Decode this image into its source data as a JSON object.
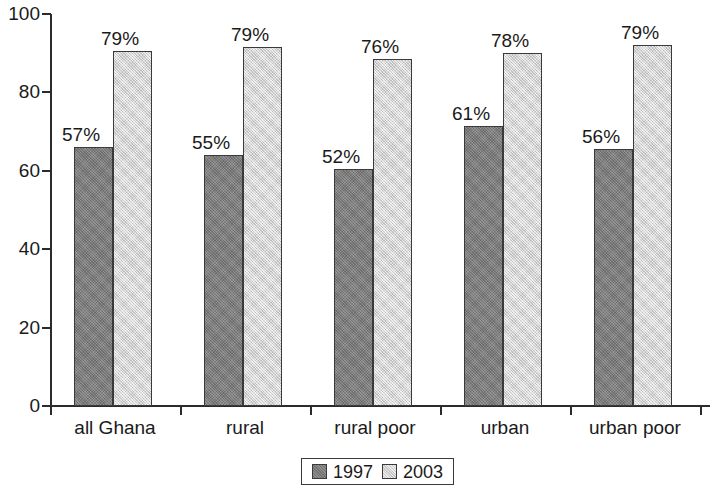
{
  "chart_data": {
    "type": "bar",
    "title": "",
    "subtitle": "",
    "xlabel": "",
    "ylabel": "",
    "ylim": [
      0,
      100
    ],
    "yticks": [
      0,
      20,
      40,
      60,
      80,
      100
    ],
    "ytick_labels": [
      "0",
      "20",
      "40",
      "60",
      "80",
      "100"
    ],
    "grid": false,
    "legend_position": "bottom-center",
    "categories": [
      "all Ghana",
      "rural",
      "rural poor",
      "urban",
      "urban poor"
    ],
    "series": [
      {
        "name": "1997",
        "color": "#808080",
        "values": [
          66,
          64,
          60.5,
          71.5,
          65.5
        ],
        "data_labels": [
          "57%",
          "55%",
          "52%",
          "61%",
          "56%"
        ]
      },
      {
        "name": "2003",
        "color": "#dcdcdc",
        "values": [
          90.5,
          91.5,
          88.5,
          90,
          92
        ],
        "data_labels": [
          "79%",
          "79%",
          "76%",
          "78%",
          "79%"
        ]
      }
    ],
    "legend": [
      "1997",
      "2003"
    ]
  },
  "legend": {
    "items": [
      {
        "label": "1997",
        "color": "#808080"
      },
      {
        "label": "2003",
        "color": "#dcdcdc"
      }
    ]
  },
  "colors": {
    "series_1997": "#808080",
    "series_2003": "#dcdcdc",
    "axis": "#2b2b2b",
    "text": "#1a1a1a",
    "background": "#ffffff"
  }
}
